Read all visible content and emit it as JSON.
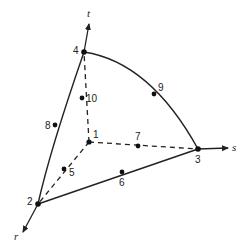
{
  "diagram": {
    "type": "curved tetrahedral element with natural coordinates",
    "axes": [
      {
        "name": "r",
        "label": "r"
      },
      {
        "name": "s",
        "label": "s"
      },
      {
        "name": "t",
        "label": "t"
      }
    ],
    "nodes": [
      {
        "id": "1",
        "label": "1",
        "kind": "vertex"
      },
      {
        "id": "2",
        "label": "2",
        "kind": "vertex"
      },
      {
        "id": "3",
        "label": "3",
        "kind": "vertex"
      },
      {
        "id": "4",
        "label": "4",
        "kind": "vertex"
      },
      {
        "id": "5",
        "label": "5",
        "kind": "midside"
      },
      {
        "id": "6",
        "label": "6",
        "kind": "midside"
      },
      {
        "id": "7",
        "label": "7",
        "kind": "midside"
      },
      {
        "id": "8",
        "label": "8",
        "kind": "midside"
      },
      {
        "id": "9",
        "label": "9",
        "kind": "midside"
      },
      {
        "id": "10",
        "label": "10",
        "kind": "midside"
      }
    ],
    "edges": [
      {
        "from": "1",
        "to": "2",
        "via": "5",
        "style": "dashed"
      },
      {
        "from": "1",
        "to": "3",
        "via": "7",
        "style": "dashed"
      },
      {
        "from": "1",
        "to": "4",
        "via": "10",
        "style": "dashed"
      },
      {
        "from": "2",
        "to": "3",
        "via": "6",
        "style": "solid"
      },
      {
        "from": "2",
        "to": "4",
        "via": "8",
        "style": "solid"
      },
      {
        "from": "3",
        "to": "4",
        "via": "9",
        "style": "solid-curved"
      }
    ],
    "colors": {
      "line": "#222222",
      "background": "#ffffff"
    }
  }
}
